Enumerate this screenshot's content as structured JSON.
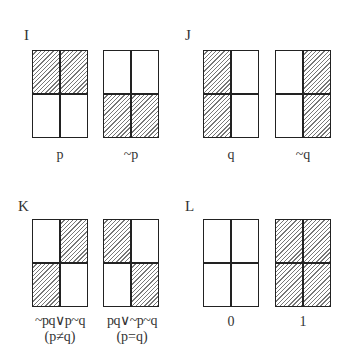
{
  "groups": [
    {
      "label": "I",
      "diagrams": [
        {
          "caption": "p",
          "caption2": "",
          "shaded": {
            "tl": true,
            "tr": true,
            "bl": false,
            "br": false
          }
        },
        {
          "caption": "~p",
          "caption2": "",
          "shaded": {
            "tl": false,
            "tr": false,
            "bl": true,
            "br": true
          }
        }
      ]
    },
    {
      "label": "J",
      "diagrams": [
        {
          "caption": "q",
          "caption2": "",
          "shaded": {
            "tl": true,
            "tr": false,
            "bl": true,
            "br": false
          }
        },
        {
          "caption": "~q",
          "caption2": "",
          "shaded": {
            "tl": false,
            "tr": true,
            "bl": false,
            "br": true
          }
        }
      ]
    },
    {
      "label": "K",
      "diagrams": [
        {
          "caption": "~pq∨p~q",
          "caption2": "(p≠q)",
          "shaded": {
            "tl": false,
            "tr": true,
            "bl": true,
            "br": false
          }
        },
        {
          "caption": "pq∨~p~q",
          "caption2": "(p=q)",
          "shaded": {
            "tl": true,
            "tr": false,
            "bl": false,
            "br": true
          }
        }
      ]
    },
    {
      "label": "L",
      "diagrams": [
        {
          "caption": "0",
          "caption2": "",
          "shaded": {
            "tl": false,
            "tr": false,
            "bl": false,
            "br": false
          }
        },
        {
          "caption": "1",
          "caption2": "",
          "shaded": {
            "tl": true,
            "tr": true,
            "bl": true,
            "br": true
          }
        }
      ]
    }
  ]
}
